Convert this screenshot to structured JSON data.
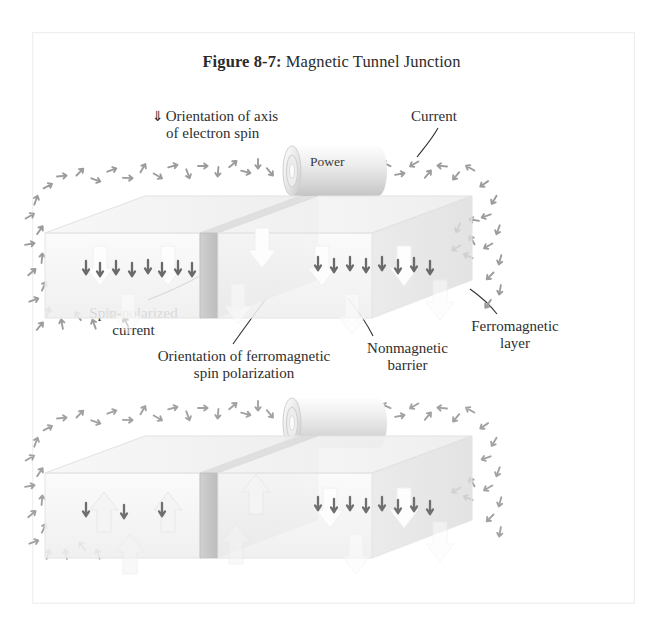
{
  "figure": {
    "number": "Figure 8-7:",
    "title": "Magnetic Tunnel Junction"
  },
  "labels": {
    "orientation_axis_line1": "Orientation of axis",
    "orientation_axis_line2": "of electron spin",
    "orientation_axis_glyph": "down-arrow-icon",
    "current": "Current",
    "spin_polarized_line1": "Spin-polarized",
    "spin_polarized_line2": "current",
    "orientation_ferro_line1": "Orientation of ferromagnetic",
    "orientation_ferro_line2": "spin polarization",
    "nonmagnetic_line1": "Nonmagnetic",
    "nonmagnetic_line2": "barrier",
    "ferro_layer_line1": "Ferromagnetic",
    "ferro_layer_line2": "layer"
  },
  "power_source": {
    "label": "Power"
  },
  "diagrams": [
    {
      "name": "parallel-state",
      "left_layer_magnetization": "down",
      "right_layer_magnetization": "down",
      "spin_arrows_in_left_block": "down",
      "spin_arrows_in_right_block": "down",
      "current_loop": "present"
    },
    {
      "name": "antiparallel-state",
      "left_layer_magnetization": "up",
      "right_layer_magnetization": "down",
      "spin_arrows_in_left_block": "down",
      "spin_arrows_in_right_block": "down",
      "current_loop": "present"
    }
  ],
  "colors": {
    "page_background": "#ffffff",
    "frame_border": "#f0f0f0",
    "text": "#2e2e2e",
    "spin_arrow_gray": "#9a9a9a",
    "polarized_arrow_dark": "#6a6a6a",
    "block_face": "#f2f2f2",
    "block_edge": "#dcdcdc",
    "barrier_gray": "#c9c9c9",
    "big_arrow_white": "#fdfdfd"
  }
}
